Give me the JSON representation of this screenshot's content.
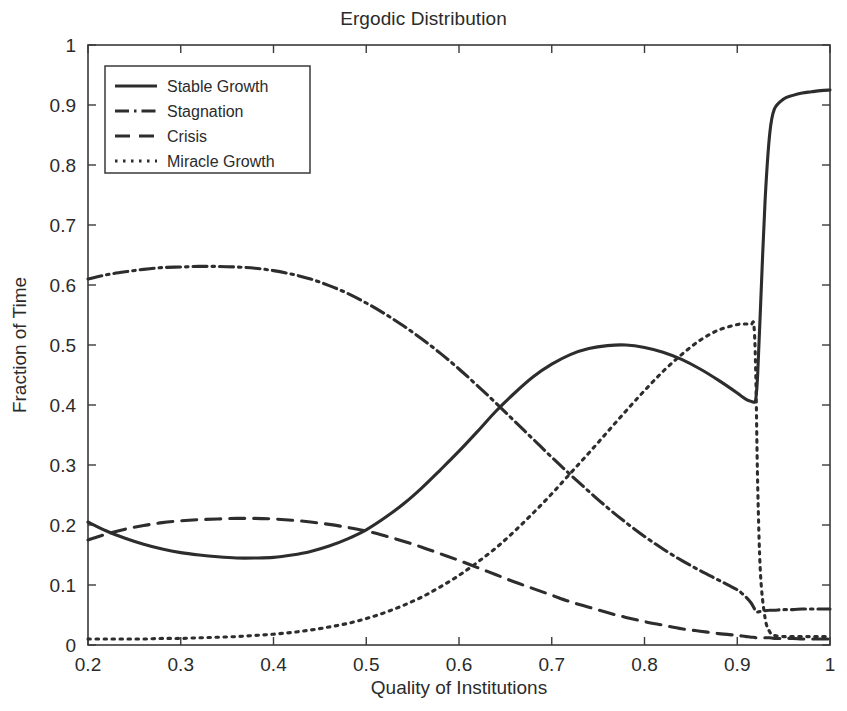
{
  "chart_data": {
    "type": "line",
    "title": "Ergodic Distribution",
    "xlabel": "Quality of Institutions",
    "ylabel": "Fraction of Time",
    "xlim": [
      0.2,
      1.0
    ],
    "ylim": [
      0,
      1
    ],
    "xticks": [
      "0.2",
      "0.3",
      "0.4",
      "0.5",
      "0.6",
      "0.7",
      "0.8",
      "0.9",
      "1"
    ],
    "xtick_values": [
      0.2,
      0.3,
      0.4,
      0.5,
      0.6,
      0.7,
      0.8,
      0.9,
      1.0
    ],
    "yticks": [
      "0",
      "0.1",
      "0.2",
      "0.3",
      "0.4",
      "0.5",
      "0.6",
      "0.7",
      "0.8",
      "0.9",
      "1"
    ],
    "ytick_values": [
      0,
      0.1,
      0.2,
      0.3,
      0.4,
      0.5,
      0.6,
      0.7,
      0.8,
      0.9,
      1.0
    ],
    "grid": false,
    "legend_position": "upper-left-inside",
    "line_color": "#2d2d2d",
    "x": [
      0.2,
      0.22,
      0.24,
      0.26,
      0.28,
      0.3,
      0.32,
      0.34,
      0.36,
      0.38,
      0.4,
      0.42,
      0.44,
      0.46,
      0.48,
      0.5,
      0.52,
      0.54,
      0.56,
      0.58,
      0.6,
      0.62,
      0.64,
      0.66,
      0.68,
      0.7,
      0.72,
      0.74,
      0.76,
      0.78,
      0.8,
      0.82,
      0.84,
      0.86,
      0.88,
      0.9,
      0.905,
      0.91,
      0.915,
      0.918,
      0.92,
      0.922,
      0.925,
      0.93,
      0.935,
      0.94,
      0.95,
      0.96,
      0.97,
      0.98,
      0.99,
      1.0
    ],
    "series": [
      {
        "name": "Stable Growth",
        "style": "solid",
        "values": [
          0.205,
          0.19,
          0.178,
          0.168,
          0.16,
          0.154,
          0.15,
          0.147,
          0.145,
          0.145,
          0.146,
          0.15,
          0.156,
          0.165,
          0.177,
          0.192,
          0.212,
          0.235,
          0.262,
          0.292,
          0.323,
          0.356,
          0.39,
          0.42,
          0.447,
          0.468,
          0.484,
          0.494,
          0.499,
          0.5,
          0.496,
          0.488,
          0.476,
          0.46,
          0.441,
          0.42,
          0.414,
          0.409,
          0.406,
          0.405,
          0.41,
          0.45,
          0.56,
          0.74,
          0.852,
          0.893,
          0.91,
          0.916,
          0.92,
          0.922,
          0.924,
          0.925
        ]
      },
      {
        "name": "Stagnation",
        "style": "dash-dot",
        "values": [
          0.61,
          0.617,
          0.622,
          0.626,
          0.629,
          0.63,
          0.631,
          0.631,
          0.63,
          0.628,
          0.624,
          0.618,
          0.61,
          0.599,
          0.586,
          0.57,
          0.552,
          0.532,
          0.51,
          0.486,
          0.46,
          0.432,
          0.403,
          0.373,
          0.343,
          0.313,
          0.284,
          0.256,
          0.229,
          0.204,
          0.181,
          0.16,
          0.141,
          0.124,
          0.108,
          0.092,
          0.086,
          0.079,
          0.07,
          0.062,
          0.056,
          0.055,
          0.056,
          0.057,
          0.058,
          0.058,
          0.059,
          0.059,
          0.06,
          0.06,
          0.06,
          0.06
        ]
      },
      {
        "name": "Crisis",
        "style": "dashed",
        "values": [
          0.175,
          0.185,
          0.193,
          0.199,
          0.204,
          0.207,
          0.209,
          0.21,
          0.211,
          0.211,
          0.21,
          0.208,
          0.205,
          0.201,
          0.196,
          0.19,
          0.182,
          0.173,
          0.163,
          0.152,
          0.141,
          0.129,
          0.117,
          0.105,
          0.094,
          0.083,
          0.072,
          0.063,
          0.054,
          0.046,
          0.039,
          0.033,
          0.027,
          0.023,
          0.019,
          0.016,
          0.015,
          0.014,
          0.013,
          0.013,
          0.012,
          0.012,
          0.012,
          0.012,
          0.012,
          0.011,
          0.011,
          0.011,
          0.01,
          0.01,
          0.01,
          0.01
        ]
      },
      {
        "name": "Miracle Growth",
        "style": "dotted",
        "values": [
          0.01,
          0.01,
          0.01,
          0.01,
          0.011,
          0.011,
          0.012,
          0.013,
          0.014,
          0.016,
          0.018,
          0.021,
          0.025,
          0.03,
          0.036,
          0.044,
          0.054,
          0.066,
          0.08,
          0.097,
          0.116,
          0.138,
          0.162,
          0.19,
          0.22,
          0.252,
          0.286,
          0.32,
          0.355,
          0.39,
          0.424,
          0.456,
          0.484,
          0.508,
          0.525,
          0.534,
          0.535,
          0.535,
          0.534,
          0.532,
          0.45,
          0.27,
          0.12,
          0.045,
          0.022,
          0.016,
          0.014,
          0.014,
          0.014,
          0.014,
          0.014,
          0.014
        ]
      }
    ]
  },
  "legend": {
    "items": [
      {
        "label": "Stable Growth",
        "style": "solid"
      },
      {
        "label": "Stagnation",
        "style": "dash-dot"
      },
      {
        "label": "Crisis",
        "style": "dashed"
      },
      {
        "label": "Miracle Growth",
        "style": "dotted"
      }
    ]
  }
}
